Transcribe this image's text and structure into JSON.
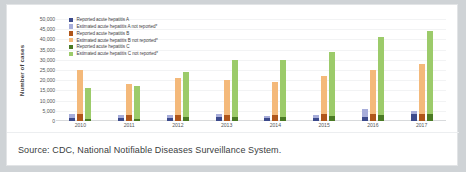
{
  "figure": {
    "caption": "Source: CDC, National Notifiable Diseases Surveillance System."
  },
  "chart_data": {
    "type": "bar",
    "title": "",
    "xlabel": "",
    "ylabel": "Number of cases",
    "ylim": [
      0,
      50000
    ],
    "ytick_values": [
      50000,
      45000,
      40000,
      35000,
      30000,
      25000,
      20000,
      15000,
      10000,
      5000,
      0
    ],
    "ytick_labels": [
      "50,000",
      "45,000",
      "40,000",
      "35,000",
      "30,000",
      "25,000",
      "20,000",
      "15,000",
      "10,000",
      "5,000",
      "0"
    ],
    "categories": [
      "2010",
      "2011",
      "2012",
      "2013",
      "2014",
      "2015",
      "2016",
      "2017"
    ],
    "grid": true,
    "legend_position": "top-left",
    "stacked_groups": [
      {
        "name": "Hepatitis A",
        "reported_series": "Reported acute hepatitis A",
        "estimated_series": "Estimated acute hepatitis A not reported*",
        "reported_color": "#3c4a8c",
        "estimated_color": "#a7adda",
        "reported_values": [
          1670,
          1398,
          1562,
          1781,
          1239,
          1390,
          2007,
          3366
        ],
        "estimated_values": [
          1830,
          1402,
          1438,
          1519,
          1161,
          1410,
          3993,
          1634
        ]
      },
      {
        "name": "Hepatitis B",
        "reported_series": "Reported acute hepatitis B",
        "estimated_series": "Estimated acute hepatitis B not reported*",
        "reported_color": "#b0561a",
        "estimated_color": "#f4b97a",
        "reported_values": [
          3350,
          2890,
          2895,
          3050,
          2953,
          3370,
          3218,
          3409
        ],
        "estimated_values": [
          21650,
          15110,
          18105,
          16950,
          16047,
          18630,
          21782,
          24591
        ]
      },
      {
        "name": "Hepatitis C",
        "reported_series": "Reported acute hepatitis C",
        "estimated_series": "Estimated acute hepatitis C not reported*",
        "reported_color": "#4a7a24",
        "estimated_color": "#9ccb6a",
        "reported_values": [
          850,
          1229,
          1778,
          2138,
          2194,
          2436,
          2967,
          3216
        ],
        "estimated_values": [
          15150,
          15771,
          22222,
          27862,
          27806,
          31564,
          38033,
          40784
        ]
      }
    ],
    "legend_entries": [
      {
        "label": "Reported acute hepatitis A",
        "color": "#3c4a8c"
      },
      {
        "label": "Estimated acute hepatitis A not reported*",
        "color": "#a7adda"
      },
      {
        "label": "Reported acute hepatitis B",
        "color": "#b0561a"
      },
      {
        "label": "Estimated acute hepatitis B not reported*",
        "color": "#f4b97a"
      },
      {
        "label": "Reported acute hepatitis C",
        "color": "#4a7a24"
      },
      {
        "label": "Estimated acute hepatitis C not reported*",
        "color": "#9ccb6a"
      }
    ]
  }
}
